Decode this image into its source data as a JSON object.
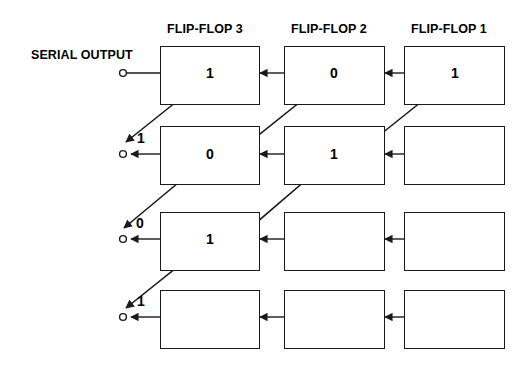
{
  "diagram": {
    "type": "shift-register-timing",
    "ink_color": "#1a1a1a",
    "background": "#ffffff",
    "serial_output_label": "SERIAL OUTPUT",
    "column_headers": [
      {
        "label": "FLIP-FLOP 3",
        "x": 210
      },
      {
        "label": "FLIP-FLOP 2",
        "x": 334
      },
      {
        "label": "FLIP-FLOP 1",
        "x": 455
      }
    ],
    "columns": [
      {
        "name": "flip-flop-3",
        "x": 160,
        "width": 100
      },
      {
        "name": "flip-flop-2",
        "x": 284,
        "width": 101
      },
      {
        "name": "flip-flop-1",
        "x": 404,
        "width": 101
      }
    ],
    "rows": [
      {
        "name": "row-1",
        "y": 46,
        "height": 59,
        "cells": [
          "1",
          "0",
          "1"
        ],
        "serial_out": ""
      },
      {
        "name": "row-2",
        "y": 126,
        "height": 59,
        "cells": [
          "0",
          "1",
          ""
        ],
        "serial_out": "1"
      },
      {
        "name": "row-3",
        "y": 212,
        "height": 59,
        "cells": [
          "1",
          "",
          ""
        ],
        "serial_out": "0"
      },
      {
        "name": "row-4",
        "y": 290,
        "height": 59,
        "cells": [
          "",
          "",
          ""
        ],
        "serial_out": "1"
      }
    ],
    "shift_arrows": [
      {
        "name": "shift-ff3-row1-to-out-row2",
        "x1": 196,
        "y1": 86,
        "x2": 126,
        "y2": 142
      },
      {
        "name": "shift-ff2-row1-to-ff3-row2",
        "x1": 320,
        "y1": 86,
        "x2": 250,
        "y2": 142
      },
      {
        "name": "shift-ff1-row1-to-ff2-row2",
        "x1": 441,
        "y1": 86,
        "x2": 371,
        "y2": 142
      },
      {
        "name": "shift-ff3-row2-to-out-row3",
        "x1": 196,
        "y1": 168,
        "x2": 124,
        "y2": 228
      },
      {
        "name": "shift-ff2-row2-to-ff3-row3",
        "x1": 320,
        "y1": 168,
        "x2": 250,
        "y2": 228
      },
      {
        "name": "shift-ff3-row3-to-out-row4",
        "x1": 196,
        "y1": 252,
        "x2": 126,
        "y2": 308
      }
    ],
    "terminals": [
      {
        "name": "serial-terminal-row-1",
        "cx": 123,
        "cy": 73
      },
      {
        "name": "serial-terminal-row-2",
        "cx": 123,
        "cy": 154
      },
      {
        "name": "serial-terminal-row-3",
        "cx": 123,
        "cy": 239
      },
      {
        "name": "serial-terminal-row-4",
        "cx": 123,
        "cy": 317
      }
    ]
  }
}
